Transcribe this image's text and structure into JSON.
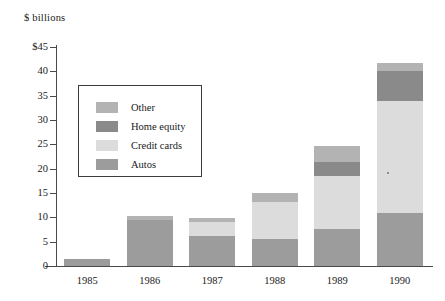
{
  "chart_data": {
    "type": "bar",
    "subtype": "stacked-vertical",
    "title": "",
    "axis_note": "$ billions",
    "xlabel": "",
    "ylabel": "",
    "categories": [
      "1985",
      "1986",
      "1987",
      "1988",
      "1989",
      "1990"
    ],
    "ylim": [
      0,
      45
    ],
    "yticks": [
      0,
      5,
      10,
      15,
      20,
      25,
      30,
      35,
      40,
      45
    ],
    "ytick_labels": [
      "0",
      "5",
      "10",
      "15",
      "20",
      "25",
      "30",
      "35",
      "40",
      "$45"
    ],
    "grid": false,
    "legend_position": "inside-upper-left",
    "stack_order_bottom_to_top": [
      "Autos",
      "Credit cards",
      "Home equity",
      "Other"
    ],
    "series": [
      {
        "name": "Autos",
        "color": "#9c9c9c",
        "values": [
          1.4,
          9.4,
          6.2,
          5.6,
          7.6,
          10.8
        ]
      },
      {
        "name": "Credit cards",
        "color": "#dcdcdc",
        "values": [
          0,
          0,
          2.9,
          7.6,
          10.9,
          23.2
        ]
      },
      {
        "name": "Home equity",
        "color": "#8a8a8a",
        "values": [
          0,
          0,
          0,
          0,
          2.8,
          6.0
        ]
      },
      {
        "name": "Other",
        "color": "#b3b3b3",
        "values": [
          0,
          0.8,
          0.8,
          1.8,
          3.3,
          1.8
        ]
      }
    ],
    "totals": [
      1.4,
      10.2,
      9.9,
      15.0,
      24.6,
      41.8
    ]
  },
  "legend": {
    "items": [
      {
        "label": "Other",
        "color": "#b3b3b3"
      },
      {
        "label": "Home equity",
        "color": "#8a8a8a"
      },
      {
        "label": "Credit cards",
        "color": "#dcdcdc"
      },
      {
        "label": "Autos",
        "color": "#9c9c9c"
      }
    ]
  },
  "colors": {
    "axis": "#4a4a4a",
    "text": "#1a1a1a",
    "legend_border": "#3d3d3d",
    "background": "#ffffff"
  }
}
